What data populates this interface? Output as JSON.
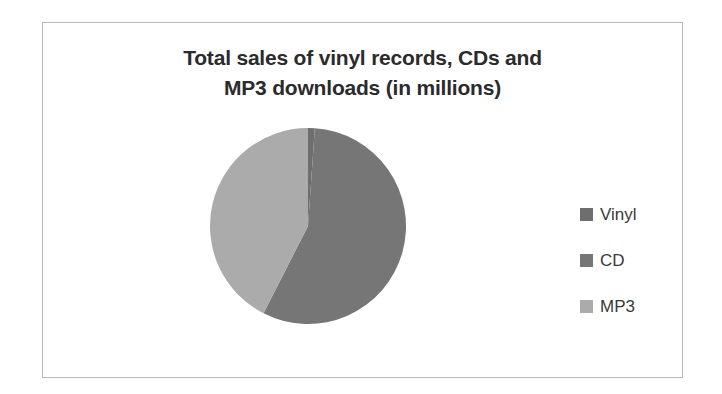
{
  "chart_data": {
    "type": "pie",
    "title": "Total sales of vinyl records, CDs and MP3 downloads (in millions)",
    "title_lines": [
      "Total sales of vinyl records, CDs and",
      "MP3 downloads (in millions)"
    ],
    "categories": [
      "Vinyl",
      "CD",
      "MP3"
    ],
    "values": [
      1,
      55,
      44
    ],
    "slices": [
      {
        "label": "Vinyl",
        "value": 1,
        "percent": 1,
        "start_angle": 0,
        "end_angle": 4,
        "color": "#6e6e6e"
      },
      {
        "label": "CD",
        "value": 55,
        "percent": 55,
        "start_angle": 4,
        "end_angle": 207,
        "color": "#767676"
      },
      {
        "label": "MP3",
        "value": 44,
        "percent": 44,
        "start_angle": 207,
        "end_angle": 360,
        "color": "#ababab"
      }
    ],
    "legend_position": "right",
    "xlabel": "",
    "ylabel": "",
    "grid": false
  },
  "legend": {
    "items": [
      {
        "label": "Vinyl",
        "color": "#6e6e6e"
      },
      {
        "label": "CD",
        "color": "#767676"
      },
      {
        "label": "MP3",
        "color": "#ababab"
      }
    ]
  },
  "colors": {
    "frame_border": "#b9b9b9",
    "background": "#ffffff",
    "title_text": "#2b2b2b",
    "legend_text": "#3a3a3a"
  }
}
